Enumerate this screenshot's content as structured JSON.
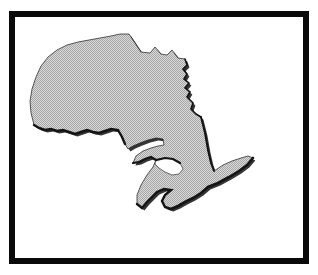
{
  "image": {
    "title": "Map of Ontario",
    "subject": "Ontario",
    "country": "Canada",
    "type": "province-silhouette-map",
    "width": 318,
    "height": 275
  },
  "frame": {
    "name": "black-border-frame",
    "border_color": "#0a0a0a",
    "border_width_px": 6,
    "background_color": "#ffffff",
    "outer_margin_color": "#ffffff"
  },
  "map": {
    "name": "ontario-silhouette",
    "fill_color": "#c0c0c0",
    "fill_style": "dithered-halftone",
    "outline_color": "#111111",
    "shadow_color": "#2a2a2a",
    "label": "Ontario",
    "bounds": {
      "x": 76,
      "y": 22,
      "width": 160,
      "height": 190
    }
  },
  "regions": {
    "hudson_bay_coast": "northern boundary",
    "james_bay_coast": "north-east boundary",
    "quebec_border": "eastern straight boundary",
    "manitoba_border": "western straight boundary",
    "lake_superior_shore": "south-west jagged shore",
    "georgian_bay": "interior white notch",
    "bruce_peninsula": "south-central peninsula",
    "lake_erie_shore": "southern shore",
    "point_pelee": "southern tip"
  },
  "colors": {
    "background": "#ffffff",
    "frame": "#0a0a0a",
    "land_fill": "#c0c0c0",
    "coast_outline": "#111111"
  }
}
